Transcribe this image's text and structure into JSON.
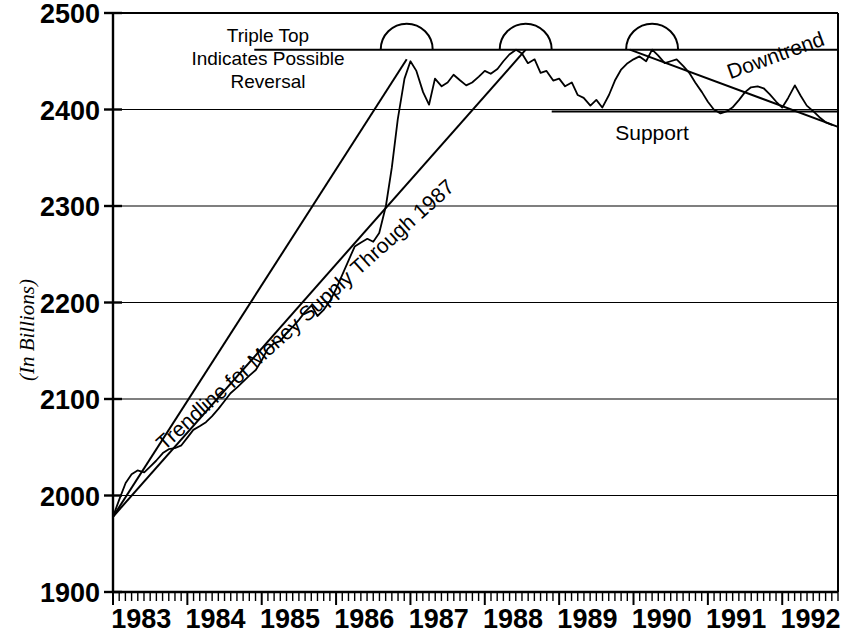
{
  "chart_data": {
    "type": "line",
    "title": "",
    "subtitle": "",
    "xlabel": "",
    "ylabel": "(In Billions)",
    "xlim": [
      1983.0,
      1992.75
    ],
    "ylim": [
      1900,
      2500
    ],
    "grid": true,
    "legend_position": "none",
    "ytick_labels": [
      "2500",
      "2400",
      "2300",
      "2200",
      "2100",
      "2000",
      "1900"
    ],
    "ytick_values": [
      2500,
      2400,
      2300,
      2200,
      2100,
      2000,
      1900
    ],
    "xtick_labels": [
      "1983",
      "1984",
      "1985",
      "1986",
      "1987",
      "1988",
      "1989",
      "1990",
      "1991",
      "1992"
    ],
    "xtick_values": [
      1983,
      1984,
      1985,
      1986,
      1987,
      1988,
      1989,
      1990,
      1991,
      1992
    ],
    "minor_xticks": "monthly",
    "series": [
      {
        "name": "Money Supply",
        "x": [
          1983.0,
          1983.08,
          1983.17,
          1983.25,
          1983.33,
          1983.42,
          1983.5,
          1983.58,
          1983.67,
          1983.75,
          1983.83,
          1983.92,
          1984.0,
          1984.08,
          1984.17,
          1984.25,
          1984.33,
          1984.42,
          1984.5,
          1984.58,
          1984.67,
          1984.75,
          1984.83,
          1984.92,
          1985.0,
          1985.08,
          1985.17,
          1985.25,
          1985.33,
          1985.42,
          1985.5,
          1985.58,
          1985.67,
          1985.75,
          1985.83,
          1985.92,
          1986.0,
          1986.08,
          1986.17,
          1986.25,
          1986.33,
          1986.42,
          1986.5,
          1986.58,
          1986.67,
          1986.75,
          1986.83,
          1986.92,
          1987.0,
          1987.08,
          1987.17,
          1987.25,
          1987.33,
          1987.42,
          1987.5,
          1987.58,
          1987.67,
          1987.75,
          1987.83,
          1987.92,
          1988.0,
          1988.08,
          1988.17,
          1988.25,
          1988.33,
          1988.42,
          1988.5,
          1988.58,
          1988.67,
          1988.75,
          1988.83,
          1988.92,
          1989.0,
          1989.08,
          1989.17,
          1989.25,
          1989.33,
          1989.42,
          1989.5,
          1989.58,
          1989.67,
          1989.75,
          1989.83,
          1989.92,
          1990.0,
          1990.08,
          1990.17,
          1990.25,
          1990.33,
          1990.42,
          1990.5,
          1990.58,
          1990.67,
          1990.75,
          1990.83,
          1990.92,
          1991.0,
          1991.08,
          1991.17,
          1991.25,
          1991.33,
          1991.42,
          1991.5,
          1991.58,
          1991.67,
          1991.75,
          1991.83,
          1991.92,
          1992.0,
          1992.08,
          1992.17,
          1992.25,
          1992.33,
          1992.42,
          1992.5,
          1992.58,
          1992.67
        ],
        "y": [
          1978,
          1995,
          2013,
          2022,
          2026,
          2024,
          2030,
          2036,
          2044,
          2048,
          2049,
          2052,
          2060,
          2068,
          2072,
          2076,
          2082,
          2090,
          2098,
          2106,
          2112,
          2118,
          2124,
          2130,
          2140,
          2152,
          2158,
          2160,
          2168,
          2175,
          2182,
          2190,
          2197,
          2186,
          2192,
          2202,
          2214,
          2228,
          2244,
          2258,
          2262,
          2266,
          2263,
          2272,
          2300,
          2340,
          2390,
          2432,
          2450,
          2440,
          2418,
          2405,
          2432,
          2424,
          2428,
          2436,
          2430,
          2425,
          2428,
          2434,
          2440,
          2437,
          2442,
          2450,
          2457,
          2462,
          2458,
          2448,
          2452,
          2438,
          2440,
          2430,
          2432,
          2424,
          2428,
          2415,
          2412,
          2404,
          2410,
          2402,
          2415,
          2430,
          2441,
          2448,
          2452,
          2455,
          2450,
          2462,
          2456,
          2448,
          2450,
          2452,
          2445,
          2438,
          2428,
          2418,
          2408,
          2400,
          2396,
          2398,
          2402,
          2410,
          2418,
          2423,
          2424,
          2422,
          2416,
          2408,
          2402,
          2412,
          2425,
          2414,
          2404,
          2398,
          2392,
          2387,
          2384
        ]
      }
    ],
    "reference_lines": [
      {
        "name": "resistance",
        "type": "horizontal",
        "value": 2462,
        "x_start": 1984.9,
        "x_end": 1992.75
      },
      {
        "name": "support",
        "type": "horizontal",
        "value": 2398,
        "x_start": 1988.9,
        "x_end": 1992.75
      },
      {
        "name": "trendline",
        "type": "segment",
        "x_start": 1983.0,
        "y_start": 1978,
        "x_end": 1988.55,
        "y_end": 2462
      },
      {
        "name": "trendline-upper",
        "type": "segment",
        "x_start": 1983.0,
        "y_start": 1978,
        "x_end": 1986.95,
        "y_end": 2452
      },
      {
        "name": "downtrend",
        "type": "segment",
        "x_start": 1989.95,
        "y_start": 2462,
        "x_end": 1992.75,
        "y_end": 2382
      }
    ],
    "markers": [
      {
        "name": "triple-top-arc-1",
        "x": 1986.95,
        "y": 2462,
        "shape": "semicircle"
      },
      {
        "name": "triple-top-arc-2",
        "x": 1988.55,
        "y": 2462,
        "shape": "semicircle"
      },
      {
        "name": "triple-top-arc-3",
        "x": 1990.25,
        "y": 2462,
        "shape": "semicircle"
      }
    ],
    "annotations": [
      {
        "name": "triple-top-note",
        "lines": [
          "Triple Top",
          "Indicates Possible",
          "Reversal"
        ],
        "rotation": 0
      },
      {
        "name": "trendline-label",
        "text": "Trendline for Money Supply Through 1987",
        "rotation": -42
      },
      {
        "name": "support-label",
        "text": "Support",
        "rotation": 0
      },
      {
        "name": "downtrend-label",
        "text": "Downtrend",
        "rotation": -20
      }
    ]
  },
  "colors": {
    "ink": "#000000",
    "background": "#ffffff",
    "grid": "#000000"
  }
}
